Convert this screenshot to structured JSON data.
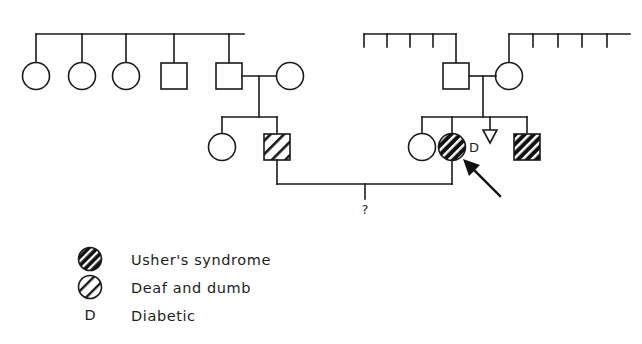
{
  "figure": {
    "type": "pedigree-chart",
    "title": "",
    "background_color": "#ffffff",
    "line_color": "#1a1a1a"
  },
  "legend": {
    "items": [
      {
        "symbol": "filled-hatched-circle",
        "label": "Usher's syndrome"
      },
      {
        "symbol": "open-hatched-circle",
        "label": "Deaf and dumb"
      },
      {
        "symbol": "letter-d",
        "symbol_text": "D",
        "label": "Diabetic"
      }
    ]
  },
  "annotations": {
    "unknown_offspring_marker": "?",
    "diabetic_marker": "D",
    "proband_arrow": "arrow"
  },
  "pedigree": {
    "generations": [
      {
        "name": "generation-1",
        "left_sibship": {
          "members": [
            {
              "shape": "circle",
              "sex": "female",
              "status": "unaffected"
            },
            {
              "shape": "circle",
              "sex": "female",
              "status": "unaffected"
            },
            {
              "shape": "circle",
              "sex": "female",
              "status": "unaffected"
            },
            {
              "shape": "square",
              "sex": "male",
              "status": "unaffected"
            },
            {
              "shape": "square",
              "sex": "male",
              "status": "unaffected"
            }
          ],
          "spouse": {
            "shape": "circle",
            "sex": "female",
            "status": "unaffected"
          }
        },
        "right_sibship": {
          "left_line_ticks": 4,
          "right_line_ticks": 4,
          "father": {
            "shape": "square",
            "sex": "male",
            "status": "unaffected"
          },
          "mother": {
            "shape": "circle",
            "sex": "female",
            "status": "unaffected"
          }
        }
      },
      {
        "name": "generation-2",
        "left_family": {
          "members": [
            {
              "shape": "circle",
              "sex": "female",
              "status": "unaffected"
            },
            {
              "shape": "square",
              "sex": "male",
              "status": "deaf-and-dumb"
            }
          ]
        },
        "right_family": {
          "members": [
            {
              "shape": "circle",
              "sex": "female",
              "status": "unaffected"
            },
            {
              "shape": "circle",
              "sex": "female",
              "status": "ushers-syndrome",
              "label": "D",
              "proband": true
            },
            {
              "shape": "triangle",
              "sex": "unknown",
              "status": "pregnancy-loss"
            },
            {
              "shape": "square",
              "sex": "male",
              "status": "ushers-syndrome"
            }
          ]
        }
      },
      {
        "name": "generation-3",
        "offspring": [
          {
            "shape": "unknown",
            "status": "unknown",
            "label": "?"
          }
        ]
      }
    ]
  }
}
